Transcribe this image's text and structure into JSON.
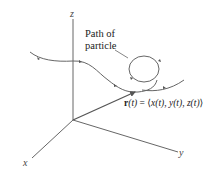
{
  "diagram": {
    "axes": {
      "x_label": "x",
      "y_label": "y",
      "z_label": "z"
    },
    "callout": {
      "line1": "Path of",
      "line2": "particle"
    },
    "vector_label": {
      "name": "r",
      "arg": "(t)",
      "equals": " = ",
      "open": "⟨",
      "x": "x(t)",
      "sep1": ", ",
      "y": "y(t)",
      "sep2": ", ",
      "z": "z(t)",
      "close": "⟩"
    },
    "colors": {
      "axis": "#555555",
      "curve": "#666666",
      "vector": "#555555",
      "text": "#222222",
      "background": "#ffffff"
    }
  }
}
